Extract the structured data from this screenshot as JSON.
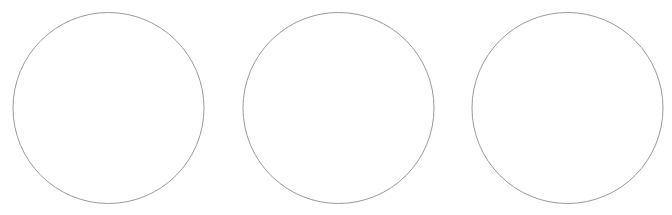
{
  "canvas": {
    "width": 672,
    "height": 215,
    "background": "#ffffff"
  },
  "style": {
    "stroke": "#9a9a9a",
    "stroke_width": 1,
    "fill": "#ffffff"
  },
  "circles": [
    {
      "cx": 108.5,
      "cy": 108,
      "r": 95.5
    },
    {
      "cx": 338.5,
      "cy": 108,
      "r": 95.5
    },
    {
      "cx": 567.5,
      "cy": 108,
      "r": 95.5
    }
  ]
}
